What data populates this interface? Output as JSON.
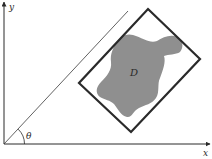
{
  "diagram": {
    "type": "geometry",
    "axes": {
      "x_label": "x",
      "y_label": "y",
      "origin": [
        4,
        144
      ],
      "x_end": [
        210,
        144
      ],
      "y_end": [
        4,
        3
      ]
    },
    "angle_line": {
      "from": [
        4,
        144
      ],
      "to": [
        128,
        11
      ],
      "angle_label": "θ"
    },
    "region": {
      "label": "D",
      "fill": "#8f8f8f"
    },
    "bounding_rectangle": {
      "corners": [
        [
          148,
          9
        ],
        [
          200,
          59
        ],
        [
          131,
          132
        ],
        [
          79,
          83
        ]
      ],
      "stroke": "#2a2a2a"
    },
    "colors": {
      "axis": "#2a2a2a",
      "background": "#ffffff"
    }
  }
}
